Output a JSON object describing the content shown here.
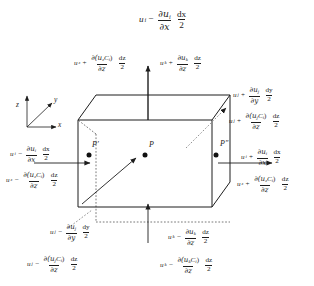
{
  "figure": {
    "type": "control-volume-diagram",
    "background_color": "#ffffff",
    "line_color": "#1d1d1d"
  },
  "axes": {
    "z_label": "z",
    "y_label": "y",
    "x_label": "x"
  },
  "points": [
    {
      "name": "point-p-prime",
      "label": "P′"
    },
    {
      "name": "point-p",
      "label": "P"
    },
    {
      "name": "point-p-dprime",
      "label": "P″"
    }
  ],
  "expressions": {
    "top_center": {
      "var": "u",
      "var_sub": "i",
      "op": "−",
      "num_d": "∂u",
      "num_d_sub": "i",
      "den_d": "∂x",
      "diff_num": "dx",
      "diff_den": "2"
    },
    "top_left": {
      "var": "u",
      "var_sub": "z",
      "op": "+",
      "num_d": "∂(u",
      "num_d_sub": "z",
      "num_d_tail": "C",
      "num_d_tail_sub": "i",
      "num_d_close": ")",
      "den_d": "∂z",
      "diff_num": "dz",
      "diff_den": "2"
    },
    "top_right": {
      "var": "u",
      "var_sub": "k",
      "op": "+",
      "num_d": "∂u",
      "num_d_sub": "k",
      "den_d": "∂z",
      "diff_num": "dz",
      "diff_den": "2"
    },
    "right_upper_a": {
      "var": "u",
      "var_sub": "j",
      "op": "+",
      "num_d": "∂u",
      "num_d_sub": "j",
      "den_d": "∂y",
      "diff_num": "dy",
      "diff_den": "2"
    },
    "right_upper_b": {
      "var": "u",
      "var_sub": "j",
      "op": "+",
      "num_d": "∂(u",
      "num_d_sub": "j",
      "num_d_tail": "C",
      "num_d_tail_sub": "i",
      "num_d_close": ")",
      "den_d": "∂z",
      "diff_num": "dz",
      "diff_den": "2"
    },
    "left_mid_a": {
      "var": "u",
      "var_sub": "i",
      "op": "−",
      "num_d": "∂u",
      "num_d_sub": "i",
      "den_d": "∂x",
      "diff_num": "dx",
      "diff_den": "2"
    },
    "left_mid_b": {
      "var": "u",
      "var_sub": "z",
      "op": "−",
      "num_d": "∂(u",
      "num_d_sub": "z",
      "num_d_tail": "C",
      "num_d_tail_sub": "i",
      "num_d_close": ")",
      "den_d": "∂z",
      "diff_num": "dz",
      "diff_den": "2"
    },
    "right_mid_a": {
      "var": "u",
      "var_sub": "i",
      "op": "+",
      "num_d": "∂u",
      "num_d_sub": "i",
      "den_d": "∂x",
      "diff_num": "dx",
      "diff_den": "2"
    },
    "right_mid_b": {
      "var": "u",
      "var_sub": "z",
      "op": "+",
      "num_d": "∂(u",
      "num_d_sub": "z",
      "num_d_tail": "C",
      "num_d_tail_sub": "i",
      "num_d_close": ")",
      "den_d": "∂z",
      "diff_num": "dz",
      "diff_den": "2"
    },
    "bottom_left_a": {
      "var": "u",
      "var_sub": "j",
      "op": "−",
      "num_d": "∂u",
      "num_d_sub": "j",
      "den_d": "∂y",
      "diff_num": "dy",
      "diff_den": "2"
    },
    "bottom_left_b": {
      "var": "u",
      "var_sub": "j",
      "op": "−",
      "num_d": "∂(u",
      "num_d_sub": "j",
      "num_d_tail": "C",
      "num_d_tail_sub": "i",
      "num_d_close": ")",
      "den_d": "∂z",
      "diff_num": "dz",
      "diff_den": "2"
    },
    "bottom_right_a": {
      "var": "u",
      "var_sub": "k",
      "op": "−",
      "num_d": "∂u",
      "num_d_sub": "k",
      "den_d": "∂z",
      "diff_num": "dz",
      "diff_den": "2"
    },
    "bottom_right_b": {
      "var": "u",
      "var_sub": "k",
      "op": "−",
      "num_d": "∂(u",
      "num_d_sub": "k",
      "num_d_tail": "C",
      "num_d_tail_sub": "i",
      "num_d_close": ")",
      "den_d": "∂z",
      "diff_num": "dz",
      "diff_den": "2"
    }
  }
}
